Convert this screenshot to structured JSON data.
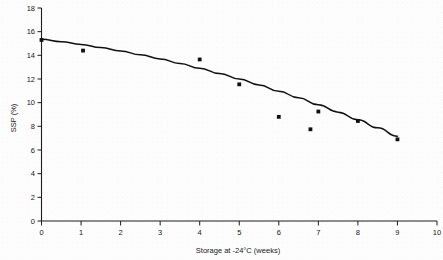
{
  "chart_data": {
    "type": "scatter",
    "title": "",
    "xlabel": "Storage at -24°C (weeks)",
    "ylabel": "SSP (%)",
    "xlim": [
      0,
      10
    ],
    "ylim": [
      0,
      18
    ],
    "grid": false,
    "legend": "none",
    "xticks": [
      "0",
      "1",
      "2",
      "3",
      "4",
      "5",
      "6",
      "7",
      "8",
      "9",
      "10"
    ],
    "xtick_values": [
      0,
      1,
      2,
      3,
      4,
      5,
      6,
      7,
      8,
      9,
      10
    ],
    "yticks": [
      "0",
      "2",
      "4",
      "6",
      "8",
      "10",
      "12",
      "14",
      "16",
      "18"
    ],
    "ytick_values": [
      0,
      2,
      4,
      6,
      8,
      10,
      12,
      14,
      16,
      18
    ],
    "series": [
      {
        "name": "SSP measurements",
        "marker": "square",
        "color": "#101010",
        "x": [
          0.0,
          1.05,
          4.0,
          5.0,
          6.0,
          6.8,
          7.0,
          8.0,
          9.0
        ],
        "y": [
          15.3,
          14.4,
          13.65,
          11.55,
          8.8,
          7.75,
          9.25,
          8.45,
          6.9
        ]
      },
      {
        "name": "fitted trend curve",
        "type": "line",
        "color": "#101010",
        "x": [
          0.0,
          0.5,
          1.0,
          1.5,
          2.0,
          2.5,
          3.0,
          3.5,
          4.0,
          4.5,
          5.0,
          5.5,
          6.0,
          6.5,
          7.0,
          7.5,
          8.0,
          8.5,
          9.0
        ],
        "y": [
          15.35,
          15.15,
          14.92,
          14.66,
          14.37,
          14.05,
          13.7,
          13.32,
          12.91,
          12.47,
          12.0,
          11.5,
          10.97,
          10.41,
          9.82,
          9.2,
          8.55,
          7.87,
          7.16
        ]
      }
    ]
  }
}
